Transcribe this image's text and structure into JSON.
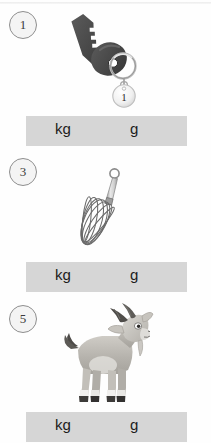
{
  "worksheet": {
    "title": "Mass units worksheet",
    "unit_options": [
      "kg",
      "g"
    ]
  },
  "questions": [
    {
      "number": "1",
      "badge_label": "1",
      "item_name": "key",
      "item_alt": "A metal door key on a key ring with a round tag",
      "tag_label": "1",
      "unit_kg": "kg",
      "unit_g": "g",
      "colors": {
        "body": "#4a4a4a",
        "body_shadow": "#3a3a3a",
        "ring": "#b9b9b9",
        "tag": "#f2f2f2"
      }
    },
    {
      "number": "3",
      "badge_label": "3",
      "item_name": "whisk",
      "item_alt": "A wire kitchen whisk with a hanging loop",
      "unit_kg": "kg",
      "unit_g": "g",
      "colors": {
        "wire": "#6e6e6e",
        "handle": "#d3d3d3",
        "handle_edge": "#8a8a8a"
      }
    },
    {
      "number": "5",
      "badge_label": "5",
      "item_name": "goat",
      "item_alt": "A cartoon goat standing with horns, beard and dark hooves",
      "unit_kg": "kg",
      "unit_g": "g",
      "colors": {
        "body": "#b9b6b0",
        "body_light": "#d8d6d2",
        "horn": "#4f4d4a",
        "hoof": "#3d3b39",
        "white": "#f3f2f0"
      }
    }
  ],
  "layout": {
    "background": "#fefefe",
    "bar_color": "#d6d6d6",
    "badge_border": "#8e8e8e"
  }
}
